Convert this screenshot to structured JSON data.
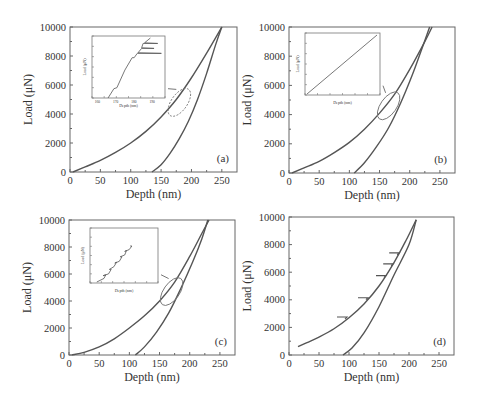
{
  "figure": {
    "panels_label": [
      "(a)",
      "(b)",
      "(c)",
      "(d)"
    ]
  },
  "chart_data": [
    {
      "type": "line",
      "panel": "(a)",
      "xlabel": "Depth (nm)",
      "ylabel": "Load (μN)",
      "xlim": [
        0,
        275
      ],
      "ylim": [
        0,
        10000
      ],
      "xticks": [
        0,
        50,
        100,
        150,
        200,
        250
      ],
      "yticks": [
        0,
        2000,
        4000,
        6000,
        8000,
        10000
      ],
      "grid": false,
      "series": [
        {
          "name": "loading",
          "x": [
            5,
            25,
            50,
            75,
            100,
            125,
            150,
            175,
            200,
            225,
            250
          ],
          "y": [
            0,
            350,
            800,
            1350,
            2000,
            2800,
            3800,
            5000,
            6500,
            8200,
            10000
          ]
        },
        {
          "name": "unloading",
          "x": [
            135,
            150,
            165,
            180,
            195,
            210,
            225,
            240,
            250
          ],
          "y": [
            0,
            500,
            1300,
            2300,
            3500,
            5000,
            6800,
            8800,
            10000
          ]
        }
      ],
      "annotations": [
        {
          "type": "ellipse",
          "x": 180,
          "y": 4800
        },
        {
          "type": "arrow",
          "to": "inset"
        }
      ],
      "inset": {
        "xlabel": "Depth (nm)",
        "ylabel": "Load (μN)",
        "xticks": [
          160,
          170,
          180,
          190
        ],
        "yticks": [
          4000,
          4500,
          5000,
          5500,
          6000,
          6500,
          7000
        ],
        "note": "staircase with pop-in bursts (horizontal excursions)"
      }
    },
    {
      "type": "line",
      "panel": "(b)",
      "xlabel": "Depth (nm)",
      "ylabel": "Load (μN)",
      "xlim": [
        0,
        275
      ],
      "ylim": [
        0,
        10000
      ],
      "xticks": [
        0,
        50,
        100,
        150,
        200,
        250
      ],
      "yticks": [
        0,
        2000,
        4000,
        6000,
        8000,
        10000
      ],
      "grid": false,
      "series": [
        {
          "name": "loading",
          "x": [
            5,
            25,
            50,
            75,
            100,
            125,
            150,
            175,
            200,
            225,
            237
          ],
          "y": [
            0,
            350,
            800,
            1400,
            2100,
            3000,
            4100,
            5400,
            7100,
            9000,
            10000
          ]
        },
        {
          "name": "unloading",
          "x": [
            108,
            125,
            145,
            165,
            185,
            205,
            220,
            233
          ],
          "y": [
            0,
            700,
            1800,
            3100,
            4800,
            6800,
            8500,
            10000
          ]
        }
      ],
      "annotations": [
        {
          "type": "ellipse",
          "x": 165,
          "y": 4600
        }
      ],
      "inset": {
        "xlabel": "Depth (nm)",
        "ylabel": "Load (μN)",
        "note": "smooth linear segment"
      }
    },
    {
      "type": "line",
      "panel": "(c)",
      "xlabel": "Depth (nm)",
      "ylabel": "Load (μN)",
      "xlim": [
        0,
        275
      ],
      "ylim": [
        0,
        10000
      ],
      "xticks": [
        0,
        50,
        100,
        150,
        200,
        250
      ],
      "yticks": [
        0,
        2000,
        4000,
        6000,
        8000,
        10000
      ],
      "grid": false,
      "series": [
        {
          "name": "loading",
          "x": [
            5,
            25,
            50,
            75,
            100,
            125,
            150,
            175,
            200,
            220,
            232
          ],
          "y": [
            0,
            200,
            600,
            1200,
            2000,
            2900,
            4000,
            5400,
            7300,
            9000,
            10000
          ]
        },
        {
          "name": "unloading",
          "x": [
            110,
            125,
            145,
            165,
            185,
            205,
            220,
            230
          ],
          "y": [
            0,
            600,
            1700,
            3100,
            4900,
            6900,
            8600,
            10000
          ]
        }
      ],
      "annotations": [
        {
          "type": "ellipse",
          "x": 170,
          "y": 4700
        }
      ],
      "inset": {
        "xlabel": "Depth (nm)",
        "ylabel": "Load (μN)",
        "note": "serrated steps"
      }
    },
    {
      "type": "line",
      "panel": "(d)",
      "xlabel": "Depth (nm)",
      "ylabel": "Load (μN)",
      "xlim": [
        0,
        275
      ],
      "ylim": [
        0,
        10000
      ],
      "xticks": [
        0,
        50,
        100,
        150,
        200,
        250
      ],
      "yticks": [
        0,
        2000,
        4000,
        6000,
        8000,
        10000
      ],
      "grid": false,
      "series": [
        {
          "name": "loading",
          "x": [
            15,
            30,
            50,
            75,
            100,
            125,
            150,
            175,
            195,
            212
          ],
          "y": [
            600,
            900,
            1300,
            1900,
            2700,
            3700,
            5000,
            6700,
            8300,
            9800
          ]
        },
        {
          "name": "unloading",
          "x": [
            90,
            105,
            125,
            150,
            175,
            200,
            212
          ],
          "y": [
            0,
            500,
            1600,
            3500,
            5800,
            8000,
            9800
          ]
        }
      ],
      "pop_in_markers": [
        {
          "x": 95,
          "y": 2750
        },
        {
          "x": 130,
          "y": 4150
        },
        {
          "x": 160,
          "y": 5750
        },
        {
          "x": 172,
          "y": 6600
        },
        {
          "x": 182,
          "y": 7400
        }
      ]
    }
  ]
}
